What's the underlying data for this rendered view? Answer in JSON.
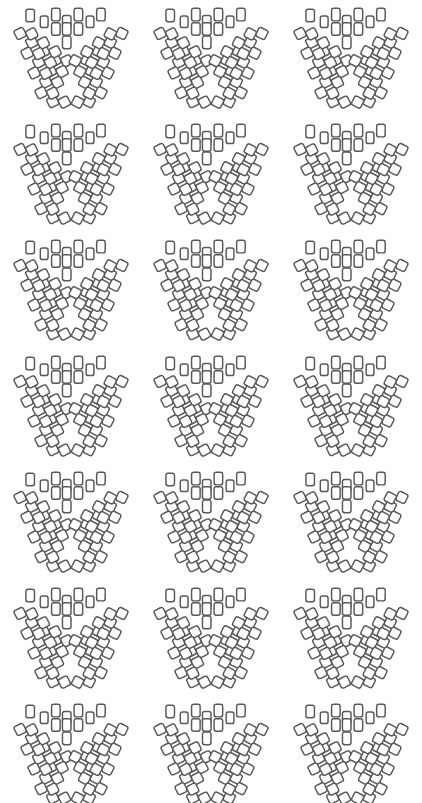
{
  "canvas": {
    "width": 422,
    "height": 803,
    "background_color": "#ffffff",
    "description": "Repeating decorative pattern sheet of V-shaped clusters of rounded rectangles"
  },
  "pattern": {
    "name": "chevron-tile-cluster-pattern",
    "motif_name": "v-cluster-motif",
    "columns": 3,
    "rows": 7,
    "total_motifs": 21,
    "column_origins_x": [
      10,
      150,
      290
    ],
    "row_origins_y": [
      2,
      118,
      234,
      350,
      466,
      582,
      698
    ],
    "motif_width": 122,
    "motif_height": 110
  },
  "style": {
    "tile_fill": "#ffffff",
    "tile_stroke": "#575757",
    "tile_stroke_width": 1.45,
    "tile_corner_radius": 2.2
  },
  "motif_geometry": {
    "tile_width": 11,
    "tile_height": 14,
    "upright_angle_deg": 0,
    "left_wing_angle_deg": -27,
    "right_wing_angle_deg": 27,
    "tiles": [
      {
        "x": 26,
        "y": 10,
        "w": 11,
        "h": 14,
        "r": 0
      },
      {
        "x": 44,
        "y": 17,
        "w": 10,
        "h": 13,
        "r": 0
      },
      {
        "x": 59,
        "y": 9,
        "w": 11,
        "h": 14,
        "r": 0
      },
      {
        "x": 73,
        "y": 17,
        "w": 11,
        "h": 14,
        "r": 0
      },
      {
        "x": 88,
        "y": 9,
        "w": 11,
        "h": 14,
        "r": 0
      },
      {
        "x": 103,
        "y": 17,
        "w": 10,
        "h": 13,
        "r": 0
      },
      {
        "x": 117,
        "y": 9,
        "w": 11,
        "h": 14,
        "r": 0
      },
      {
        "x": 59,
        "y": 25,
        "w": 11,
        "h": 14,
        "r": 0
      },
      {
        "x": 73,
        "y": 25,
        "w": 11,
        "h": 14,
        "r": 0
      },
      {
        "x": 88,
        "y": 25,
        "w": 11,
        "h": 14,
        "r": 0
      },
      {
        "x": 73,
        "y": 40,
        "w": 11,
        "h": 14,
        "r": 0
      },
      {
        "x": 13,
        "y": 30,
        "w": 13,
        "h": 11,
        "r": -27
      },
      {
        "x": 28,
        "y": 40,
        "w": 13,
        "h": 11,
        "r": -27
      },
      {
        "x": 43,
        "y": 50,
        "w": 13,
        "h": 11,
        "r": -27
      },
      {
        "x": 58,
        "y": 60,
        "w": 13,
        "h": 11,
        "r": -27
      },
      {
        "x": 22,
        "y": 52,
        "w": 13,
        "h": 11,
        "r": -27
      },
      {
        "x": 37,
        "y": 62,
        "w": 13,
        "h": 11,
        "r": -27
      },
      {
        "x": 52,
        "y": 72,
        "w": 13,
        "h": 11,
        "r": -27
      },
      {
        "x": 31,
        "y": 74,
        "w": 13,
        "h": 11,
        "r": -27
      },
      {
        "x": 46,
        "y": 84,
        "w": 13,
        "h": 11,
        "r": -27
      },
      {
        "x": 40,
        "y": 96,
        "w": 13,
        "h": 11,
        "r": -27
      },
      {
        "x": 55,
        "y": 106,
        "w": 13,
        "h": 11,
        "r": -27
      },
      {
        "x": 144,
        "y": 30,
        "w": 13,
        "h": 11,
        "r": 27
      },
      {
        "x": 129,
        "y": 40,
        "w": 13,
        "h": 11,
        "r": 27
      },
      {
        "x": 114,
        "y": 50,
        "w": 13,
        "h": 11,
        "r": 27
      },
      {
        "x": 99,
        "y": 60,
        "w": 13,
        "h": 11,
        "r": 27
      },
      {
        "x": 135,
        "y": 52,
        "w": 13,
        "h": 11,
        "r": 27
      },
      {
        "x": 120,
        "y": 62,
        "w": 13,
        "h": 11,
        "r": 27
      },
      {
        "x": 105,
        "y": 72,
        "w": 13,
        "h": 11,
        "r": 27
      },
      {
        "x": 126,
        "y": 74,
        "w": 13,
        "h": 11,
        "r": 27
      },
      {
        "x": 111,
        "y": 84,
        "w": 13,
        "h": 11,
        "r": 27
      },
      {
        "x": 117,
        "y": 96,
        "w": 13,
        "h": 11,
        "r": 27
      },
      {
        "x": 102,
        "y": 106,
        "w": 13,
        "h": 11,
        "r": 27
      }
    ]
  }
}
